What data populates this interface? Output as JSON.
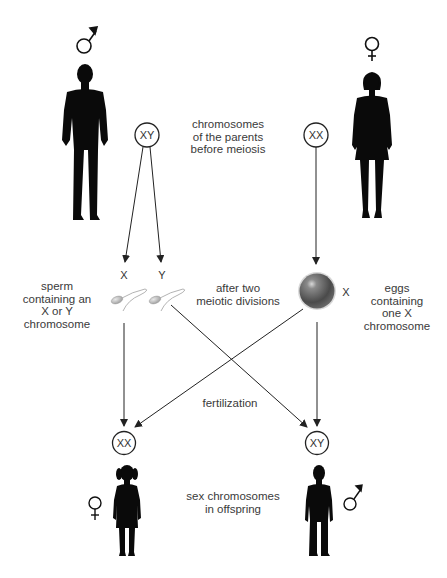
{
  "diagram": {
    "parents": {
      "male": {
        "symbol": "♂",
        "chromosomes": "XY"
      },
      "female": {
        "symbol": "♀",
        "chromosomes": "XX"
      },
      "caption_lines": [
        "chromosomes",
        "of the parents",
        "before meiosis"
      ]
    },
    "gametes": {
      "sperm_labels": [
        "X",
        "Y"
      ],
      "egg_label": "X",
      "sperm_caption_lines": [
        "sperm",
        "containing an",
        "X or Y",
        "chromosome"
      ],
      "egg_caption_lines": [
        "eggs",
        "containing",
        "one X",
        "chromosome"
      ],
      "meiosis_caption_lines": [
        "after two",
        "meiotic divisions"
      ]
    },
    "fertilization_label": "fertilization",
    "offspring": {
      "daughter": {
        "symbol": "♀",
        "chromosomes": "XX"
      },
      "son": {
        "symbol": "♂",
        "chromosomes": "XY"
      },
      "caption_lines": [
        "sex chromosomes",
        "in offspring"
      ]
    },
    "colors": {
      "line": "#333333",
      "silhouette": "#0a0a0a",
      "egg": "#5a5a5a",
      "sperm": "#a8a8a8"
    }
  }
}
